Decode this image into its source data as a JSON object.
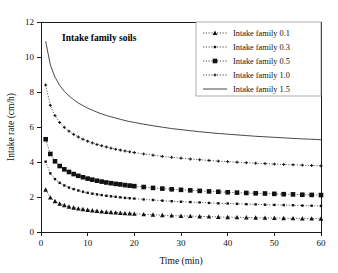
{
  "figure": {
    "annotation": "Intake family soils",
    "background_color": "#ffffff",
    "ink_color": "#1a1a1a"
  },
  "chart_data": {
    "type": "line",
    "title": "Intake family soils",
    "xlabel": "Time (min)",
    "ylabel": "Intake rate (cm/h)",
    "xlim": [
      0,
      60
    ],
    "ylim": [
      0,
      12
    ],
    "xticks": [
      0,
      10,
      20,
      30,
      40,
      50,
      60
    ],
    "yticks": [
      0,
      2,
      4,
      6,
      8,
      10,
      12
    ],
    "grid": false,
    "legend_position": "top-right",
    "x": [
      1,
      2,
      3,
      4,
      5,
      6,
      7,
      8,
      9,
      10,
      11,
      12,
      13,
      14,
      15,
      16,
      17,
      18,
      19,
      20,
      22,
      24,
      26,
      28,
      30,
      32,
      34,
      36,
      38,
      40,
      42,
      44,
      46,
      48,
      50,
      52,
      54,
      56,
      58,
      60
    ],
    "series": [
      {
        "name": "Intake family 0.1",
        "marker": "triangle",
        "linestyle": "dotted",
        "values": [
          2.42,
          1.97,
          1.76,
          1.62,
          1.53,
          1.45,
          1.39,
          1.34,
          1.3,
          1.26,
          1.23,
          1.2,
          1.17,
          1.15,
          1.13,
          1.11,
          1.09,
          1.07,
          1.06,
          1.04,
          1.01,
          0.99,
          0.96,
          0.94,
          0.92,
          0.91,
          0.89,
          0.88,
          0.86,
          0.85,
          0.84,
          0.83,
          0.82,
          0.81,
          0.8,
          0.79,
          0.78,
          0.77,
          0.77,
          0.76
        ]
      },
      {
        "name": "Intake family 0.3",
        "marker": "small-dot",
        "linestyle": "dotted",
        "values": [
          4.02,
          3.35,
          3.02,
          2.81,
          2.66,
          2.54,
          2.45,
          2.37,
          2.3,
          2.24,
          2.19,
          2.15,
          2.11,
          2.07,
          2.04,
          2.01,
          1.98,
          1.95,
          1.93,
          1.91,
          1.86,
          1.83,
          1.79,
          1.76,
          1.73,
          1.71,
          1.69,
          1.66,
          1.64,
          1.63,
          1.61,
          1.59,
          1.58,
          1.56,
          1.55,
          1.54,
          1.53,
          1.51,
          1.5,
          1.49
        ]
      },
      {
        "name": "Intake family 0.5",
        "marker": "square",
        "linestyle": "dotted",
        "values": [
          5.3,
          4.46,
          4.04,
          3.77,
          3.58,
          3.43,
          3.31,
          3.21,
          3.13,
          3.05,
          2.99,
          2.93,
          2.88,
          2.83,
          2.79,
          2.75,
          2.72,
          2.68,
          2.65,
          2.62,
          2.57,
          2.52,
          2.48,
          2.44,
          2.41,
          2.38,
          2.35,
          2.32,
          2.3,
          2.27,
          2.25,
          2.23,
          2.21,
          2.2,
          2.18,
          2.16,
          2.15,
          2.13,
          2.12,
          2.11
        ]
      },
      {
        "name": "Intake family 1.0",
        "marker": "small-plus",
        "linestyle": "dotted",
        "values": [
          8.4,
          7.24,
          6.65,
          6.26,
          5.98,
          5.76,
          5.58,
          5.43,
          5.3,
          5.19,
          5.09,
          5.0,
          4.93,
          4.86,
          4.79,
          4.73,
          4.68,
          4.63,
          4.58,
          4.54,
          4.46,
          4.39,
          4.32,
          4.27,
          4.22,
          4.17,
          4.13,
          4.09,
          4.05,
          4.02,
          3.99,
          3.96,
          3.93,
          3.91,
          3.88,
          3.86,
          3.84,
          3.82,
          3.8,
          3.78
        ]
      },
      {
        "name": "Intake family 1.5",
        "marker": "none",
        "linestyle": "solid",
        "values": [
          10.9,
          9.55,
          8.85,
          8.38,
          8.04,
          7.78,
          7.56,
          7.37,
          7.22,
          7.08,
          6.96,
          6.85,
          6.75,
          6.66,
          6.58,
          6.51,
          6.44,
          6.37,
          6.31,
          6.26,
          6.16,
          6.07,
          5.99,
          5.91,
          5.85,
          5.79,
          5.73,
          5.68,
          5.63,
          5.59,
          5.55,
          5.51,
          5.47,
          5.44,
          5.41,
          5.38,
          5.35,
          5.32,
          5.3,
          5.27
        ]
      }
    ]
  },
  "axes": {
    "x_tick_labels": [
      "0",
      "10",
      "20",
      "30",
      "40",
      "50",
      "60"
    ],
    "y_tick_labels": [
      "0",
      "2",
      "4",
      "6",
      "8",
      "10",
      "12"
    ],
    "x_axis_title": "Time (min)",
    "y_axis_title": "Intake rate (cm/h)"
  },
  "legend": {
    "entries": [
      {
        "label": "Intake family 0.1"
      },
      {
        "label": "Intake family 0.3"
      },
      {
        "label": "Intake family 0.5"
      },
      {
        "label": "Intake family 1.0"
      },
      {
        "label": "Intake family 1.5"
      }
    ]
  }
}
